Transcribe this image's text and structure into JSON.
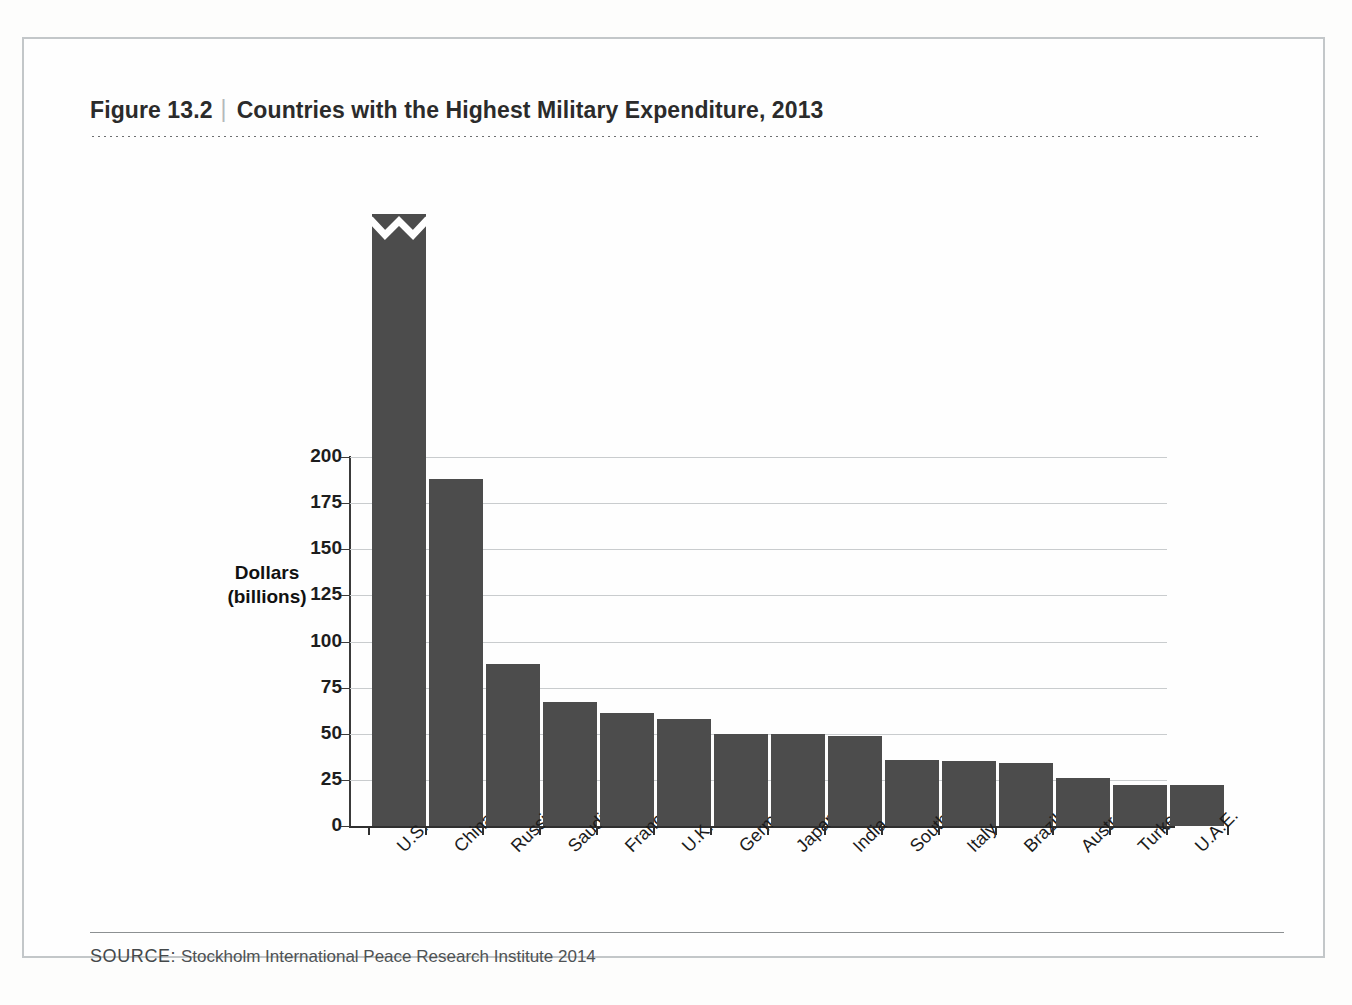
{
  "figure": {
    "number": "Figure 13.2",
    "divider": "|",
    "title": "Countries with the Highest Military Expenditure, 2013",
    "source_kicker": "SOURCE:",
    "source_text": "Stockholm International Peace Research Institute 2014"
  },
  "colors": {
    "bar": "#4c4c4c",
    "gridline": "#c9ccce",
    "axis": "#2f2f2f",
    "frame": "#c3c7c9",
    "text": "#1d1d1d"
  },
  "chart_data": {
    "type": "bar",
    "title": "Countries with the Highest Military Expenditure, 2013",
    "xlabel": "",
    "ylabel": "Dollars (billions)",
    "ylabel_lines": [
      "Dollars",
      "(billions)"
    ],
    "ylim": [
      0,
      200
    ],
    "yticks": [
      0,
      25,
      50,
      75,
      100,
      125,
      150,
      175,
      200
    ],
    "ytick_labels": [
      "0",
      "25",
      "50",
      "75",
      "100",
      "125",
      "150",
      "175",
      "200"
    ],
    "grid": true,
    "legend": null,
    "axis_break": {
      "category": "U.S.",
      "note": "bar truncated with zig-zag break; true value shown as data label",
      "label": "640"
    },
    "categories": [
      "U.S.",
      "China",
      "Russia",
      "Saudi Arabia",
      "France",
      "U.K.",
      "Germany",
      "Japan",
      "India",
      "South Korea",
      "Italy",
      "Brazil",
      "Australia",
      "Turkey",
      "U.A.E."
    ],
    "values": [
      640,
      188,
      88,
      67,
      61,
      58,
      50,
      50,
      49,
      36,
      35,
      34,
      26,
      22,
      22
    ],
    "data_labels": [
      "640",
      "",
      "",
      "",
      "",
      "",
      "",
      "",
      "",
      "",
      "",
      "",
      "",
      "",
      ""
    ]
  }
}
